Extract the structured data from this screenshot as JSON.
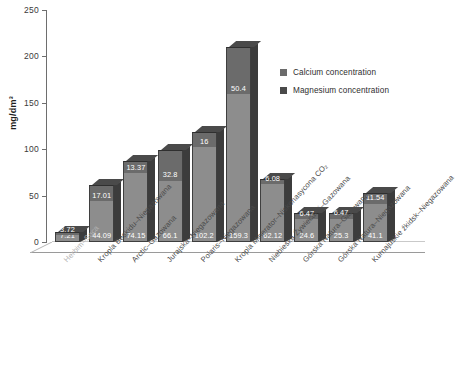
{
  "chart_data": {
    "type": "bar",
    "stacked": true,
    "title": "",
    "xlabel": "",
    "ylabel": "mg/dm³",
    "ylim": [
      0,
      250
    ],
    "yticks": [
      0,
      50,
      100,
      150,
      200,
      250
    ],
    "grid": false,
    "legend_position": "right",
    "categories": [
      "Herbim–Soca",
      "Kropla Beskidu–Niegazowana",
      "Arctic–Gazowana",
      "Jurajska–Niegazowana",
      "Polaris–Niegazowana",
      "Kropla Minerator–Niskonasycona CO₂",
      "Niebieska Żywiecdrój–Gazowana",
      "Górska Natura–Gazowana",
      "Górska Natura–Niegazowana",
      "Kurnajuskie źkidsk–Niegazowana"
    ],
    "series": [
      {
        "name": "Calcium concentration",
        "color": "#8d8d8d",
        "values": [
          7.21,
          44.09,
          74.15,
          66.1,
          102.2,
          159.3,
          62.12,
          24.6,
          25.3,
          41.1
        ]
      },
      {
        "name": "Magnesium concentration",
        "color": "#6b6b6b",
        "values": [
          3.72,
          17.01,
          13.37,
          32.8,
          16,
          50.4,
          6.08,
          6.47,
          6.47,
          11.54
        ]
      }
    ]
  },
  "legend": {
    "items": [
      {
        "label": "Calcium concentration",
        "color": "#6b6b6b"
      },
      {
        "label": "Magnesium concentration",
        "color": "#4a4a4a"
      }
    ]
  }
}
